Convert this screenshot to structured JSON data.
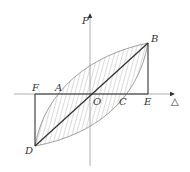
{
  "diagram": {
    "type": "hysteresis-loop",
    "axes": {
      "y_label": "P",
      "x_label": "△"
    },
    "points": {
      "B": "B",
      "D": "D",
      "F": "F",
      "A": "A",
      "O": "O",
      "C": "C",
      "E": "E"
    },
    "colors": {
      "axis": "#999999",
      "loop": "#888888",
      "line": "#333333"
    }
  }
}
